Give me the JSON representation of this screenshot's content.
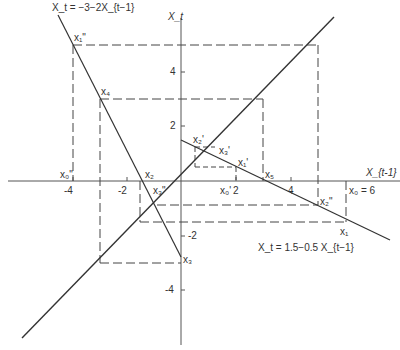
{
  "diagram": {
    "axes": {
      "x_label": "X_{t-1}",
      "y_label": "X_t",
      "x_ticks": [
        "-4",
        "-2",
        "2",
        "4"
      ],
      "y_ticks": [
        "4",
        "2",
        "-2",
        "-4"
      ]
    },
    "equations": {
      "steep": "X_t = −3−2X_{t−1}",
      "flat": "X_t = 1.5−0.5 X_{t−1}"
    },
    "labels": {
      "x1pp": "x₁\"",
      "x4": "x₄",
      "x0pp": "x₀\"",
      "x2": "x₂",
      "x3pp": "x₃\"",
      "x3": "x₃",
      "x2p": "x₂'",
      "x3p": "x₃'",
      "x1p": "x₁'",
      "x0p": "x₀'",
      "x5": "x₅",
      "x2pp": "x₂\"",
      "x1": "x₁",
      "x0eq": "x₀ = 6"
    },
    "colors": {
      "line": "#333333",
      "axis": "#555555",
      "dash": "#444444"
    }
  }
}
